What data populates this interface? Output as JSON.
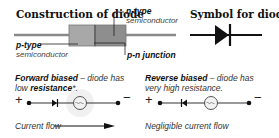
{
  "construction": {
    "title": "Construction of diode",
    "n_type_label": "n-type",
    "n_type_sub": "semiconductor",
    "p_type_label": "p-type",
    "p_type_sub": "semiconductor",
    "pn_junction_label": "p-n junction"
  },
  "symbol": {
    "title": "Symbol for diode"
  },
  "forward": {
    "heading": "Forward biased",
    "text_1": " – diode has",
    "text_2": "low ",
    "resistance": "resistance",
    "asterisk": "*.",
    "plus": "+",
    "minus": "−",
    "flow": "Current flow"
  },
  "reverse": {
    "heading": "Reverse biased",
    "text_1": " – diode has",
    "text_2": "very high resistance.",
    "plus": "+",
    "minus": "−",
    "flow": "Negligible current flow"
  },
  "colors": {
    "p_region": "#a8a8a8",
    "n_region": "#8e8e8e",
    "wire": "#555555",
    "lamp_glow": "#d8d8d8"
  }
}
